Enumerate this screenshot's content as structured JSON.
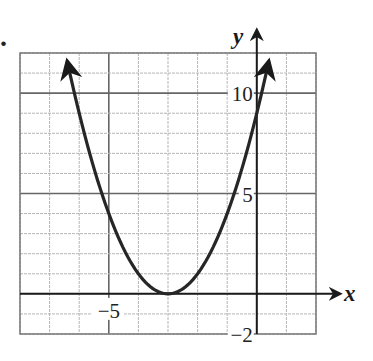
{
  "problem_marker": ".",
  "chart_data": {
    "type": "line",
    "title": "",
    "function": "y = (x + 3)^2",
    "xlabel": "x",
    "ylabel": "y",
    "xlim": [
      -8,
      2
    ],
    "ylim": [
      -2,
      12
    ],
    "grid": true,
    "grid_step_x": 1,
    "grid_step_y": 1,
    "major_lines_x": [
      -5
    ],
    "major_lines_y": [
      5,
      10
    ],
    "x_tick_labels": [
      {
        "value": -5,
        "label": "−5"
      }
    ],
    "y_tick_labels": [
      {
        "value": 10,
        "label": "10"
      },
      {
        "value": 5,
        "label": "5"
      },
      {
        "value": -2,
        "label": "−2"
      }
    ],
    "vertex": {
      "x": -3,
      "y": 0
    },
    "y_intercept": 9,
    "curve_arrows": "both ends",
    "series": [
      {
        "name": "parabola",
        "x": [
          -6.4,
          -6,
          -5.5,
          -5,
          -4.5,
          -4,
          -3.5,
          -3,
          -2.5,
          -2,
          -1.5,
          -1,
          -0.5,
          0,
          0.4
        ],
        "y": [
          11.56,
          9,
          6.25,
          4,
          2.25,
          1,
          0.25,
          0,
          0.25,
          1,
          2.25,
          4,
          6.25,
          9,
          11.56
        ]
      }
    ]
  }
}
